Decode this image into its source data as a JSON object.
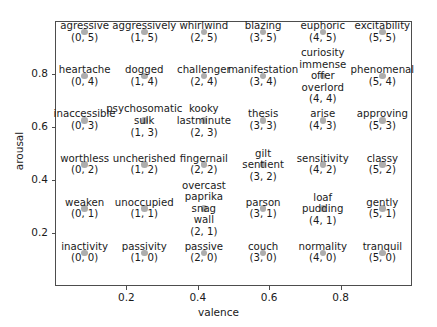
{
  "chart_data": {
    "type": "scatter",
    "title": "",
    "xlabel": "valence",
    "ylabel": "arousal",
    "xlim": [
      0,
      1
    ],
    "ylim": [
      0,
      1
    ],
    "xticks": [
      "0.2",
      "0.4",
      "0.6",
      "0.8"
    ],
    "xtick_values": [
      0.2,
      0.4,
      0.6,
      0.8
    ],
    "yticks": [
      "0.2",
      "0.4",
      "0.6",
      "0.8"
    ],
    "ytick_values": [
      0.2,
      0.4,
      0.6,
      0.8
    ],
    "grid": false,
    "legend": "none",
    "marker_color": "#adadad",
    "frame_color": "#4d4d4d",
    "points": [
      {
        "words": [
          "agressive"
        ],
        "coord": "(0, 5)",
        "x": 0.083,
        "y": 0.958
      },
      {
        "words": [
          "aggressively"
        ],
        "coord": "(1, 5)",
        "x": 0.25,
        "y": 0.958
      },
      {
        "words": [
          "whirlwind"
        ],
        "coord": "(2, 5)",
        "x": 0.417,
        "y": 0.958
      },
      {
        "words": [
          "blazing"
        ],
        "coord": "(3, 5)",
        "x": 0.583,
        "y": 0.958
      },
      {
        "words": [
          "euphoric"
        ],
        "coord": "(4, 5)",
        "x": 0.75,
        "y": 0.958
      },
      {
        "words": [
          "excitability"
        ],
        "coord": "(5, 5)",
        "x": 0.917,
        "y": 0.958
      },
      {
        "words": [
          "heartache"
        ],
        "coord": "(0, 4)",
        "x": 0.083,
        "y": 0.792
      },
      {
        "words": [
          "dogged"
        ],
        "coord": "(1, 4)",
        "x": 0.25,
        "y": 0.792
      },
      {
        "words": [
          "challenger"
        ],
        "coord": "(2, 4)",
        "x": 0.417,
        "y": 0.792
      },
      {
        "words": [
          "manifestation"
        ],
        "coord": "(3, 4)",
        "x": 0.583,
        "y": 0.792
      },
      {
        "words": [
          "curiosity",
          "immense",
          "offer",
          "overlord"
        ],
        "coord": "(4, 4)",
        "x": 0.75,
        "y": 0.792
      },
      {
        "words": [
          "phenomenal"
        ],
        "coord": "(5, 4)",
        "x": 0.917,
        "y": 0.792
      },
      {
        "words": [
          "inaccessible"
        ],
        "coord": "(0, 3)",
        "x": 0.083,
        "y": 0.625
      },
      {
        "words": [
          "psychosomatic",
          "sulk"
        ],
        "coord": "(1, 3)",
        "x": 0.25,
        "y": 0.625
      },
      {
        "words": [
          "kooky",
          "lastminute"
        ],
        "coord": "(2, 3)",
        "x": 0.417,
        "y": 0.625
      },
      {
        "words": [
          "thesis"
        ],
        "coord": "(3, 3)",
        "x": 0.583,
        "y": 0.625
      },
      {
        "words": [
          "arise"
        ],
        "coord": "(4, 3)",
        "x": 0.75,
        "y": 0.625
      },
      {
        "words": [
          "approving"
        ],
        "coord": "(5, 3)",
        "x": 0.917,
        "y": 0.625
      },
      {
        "words": [
          "worthless"
        ],
        "coord": "(0, 2)",
        "x": 0.083,
        "y": 0.458
      },
      {
        "words": [
          "uncherished"
        ],
        "coord": "(1, 2)",
        "x": 0.25,
        "y": 0.458
      },
      {
        "words": [
          "fingernail"
        ],
        "coord": "(2, 2)",
        "x": 0.417,
        "y": 0.458
      },
      {
        "words": [
          "gilt",
          "sentient"
        ],
        "coord": "(3, 2)",
        "x": 0.583,
        "y": 0.458
      },
      {
        "words": [
          "sensitivity"
        ],
        "coord": "(4, 2)",
        "x": 0.75,
        "y": 0.458
      },
      {
        "words": [
          "classy"
        ],
        "coord": "(5, 2)",
        "x": 0.917,
        "y": 0.458
      },
      {
        "words": [
          "weaken"
        ],
        "coord": "(0, 1)",
        "x": 0.083,
        "y": 0.292
      },
      {
        "words": [
          "unoccupied"
        ],
        "coord": "(1, 1)",
        "x": 0.25,
        "y": 0.292
      },
      {
        "words": [
          "overcast",
          "paprika",
          "snag",
          "wall"
        ],
        "coord": "(2, 1)",
        "x": 0.417,
        "y": 0.292
      },
      {
        "words": [
          "parson"
        ],
        "coord": "(3, 1)",
        "x": 0.583,
        "y": 0.292
      },
      {
        "words": [
          "loaf",
          "pudding"
        ],
        "coord": "(4, 1)",
        "x": 0.75,
        "y": 0.292
      },
      {
        "words": [
          "gently"
        ],
        "coord": "(5, 1)",
        "x": 0.917,
        "y": 0.292
      },
      {
        "words": [
          "inactivity"
        ],
        "coord": "(0, 0)",
        "x": 0.083,
        "y": 0.125
      },
      {
        "words": [
          "passivity"
        ],
        "coord": "(1, 0)",
        "x": 0.25,
        "y": 0.125
      },
      {
        "words": [
          "passive"
        ],
        "coord": "(2, 0)",
        "x": 0.417,
        "y": 0.125
      },
      {
        "words": [
          "couch"
        ],
        "coord": "(3, 0)",
        "x": 0.583,
        "y": 0.125
      },
      {
        "words": [
          "normality"
        ],
        "coord": "(4, 0)",
        "x": 0.75,
        "y": 0.125
      },
      {
        "words": [
          "tranquil"
        ],
        "coord": "(5, 0)",
        "x": 0.917,
        "y": 0.125
      }
    ]
  }
}
